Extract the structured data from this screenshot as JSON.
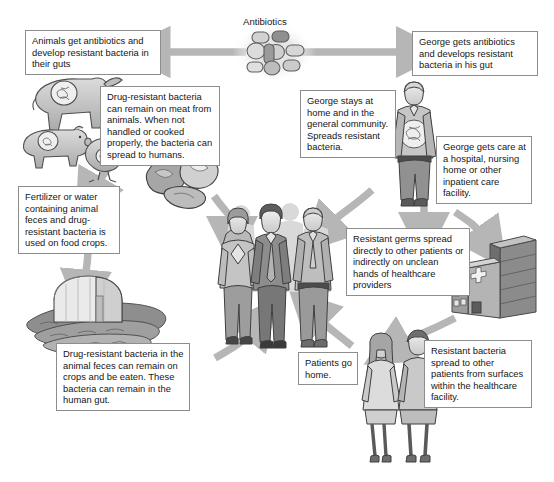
{
  "diagram": {
    "title_label": "Antibiotics",
    "palette": {
      "arrow": "#b6b6b6",
      "box_border": "#8d8d8d",
      "ink": "#161616",
      "figure_light": "#d8d8d8",
      "figure_mid": "#a8a8a8",
      "figure_dark": "#6f6f6f",
      "background": "#ffffff"
    },
    "boxes": {
      "animals_get_antibiotics": "Animals get antibiotics and develop resistant bacteria in their guts",
      "drug_resistant_meat": "Drug-resistant bacteria can remain on meat from animals. When not handled or cooked properly, the bacteria can spread to humans.",
      "fertilizer_or_water": "Fertilizer or water containing animal feces and drug-resistant bacteria is used on food crops.",
      "bacteria_on_crops": "Drug-resistant bacteria in the animal feces can remain on crops and be eaten. These bacteria can remain in the human gut.",
      "george_gets_antibiotics": "George gets antibiotics and develops resistant bacteria in his gut",
      "george_stays_home": "George stays at home and in the general community. Spreads resistant bacteria.",
      "george_gets_care": "George gets care at a hospital, nursing home or other inpatient care facility.",
      "resistant_germs_spread": "Resistant germs spread directly to other patients or indirectly on unclean hands of healthcare providers",
      "patients_go_home": "Patients go home.",
      "resistant_bacteria_surfaces": "Resistant bacteria spread to other patients from surfaces within the healthcare facility."
    },
    "illustrations": [
      {
        "name": "antibiotic-pills-illustration",
        "caption": "Antibiotics"
      },
      {
        "name": "cow-illustration",
        "caption": ""
      },
      {
        "name": "pig-illustration",
        "caption": ""
      },
      {
        "name": "chicken-illustration",
        "caption": ""
      },
      {
        "name": "raw-meat-illustration",
        "caption": ""
      },
      {
        "name": "greenhouse-crops-illustration",
        "caption": ""
      },
      {
        "name": "community-people-illustration",
        "caption": ""
      },
      {
        "name": "george-figure-illustration",
        "caption": ""
      },
      {
        "name": "hospital-building-illustration",
        "caption": ""
      },
      {
        "name": "hospital-patients-illustration",
        "caption": ""
      }
    ]
  }
}
